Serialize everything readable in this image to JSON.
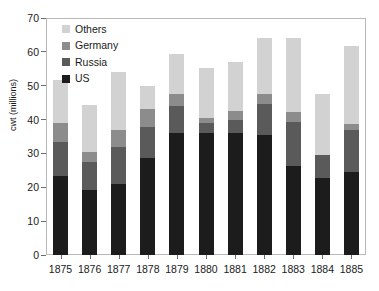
{
  "chart_data": {
    "type": "bar",
    "subtype": "stacked-bar",
    "title": "",
    "xlabel": "",
    "ylabel": "cwt (millions)",
    "ylim": [
      0,
      70
    ],
    "yticks": [
      0,
      10,
      20,
      30,
      40,
      50,
      60,
      70
    ],
    "grid": false,
    "legend_position": "top-left",
    "categories": [
      "1875",
      "1876",
      "1877",
      "1878",
      "1879",
      "1880",
      "1881",
      "1882",
      "1883",
      "1884",
      "1885"
    ],
    "series": [
      {
        "name": "US",
        "color": "#1c1c1c",
        "values": [
          23.4,
          19.2,
          21.0,
          28.8,
          36.0,
          36.0,
          36.0,
          35.3,
          26.2,
          22.6,
          24.4
        ]
      },
      {
        "name": "Russia",
        "color": "#5a5a5a",
        "values": [
          10.1,
          8.3,
          11.0,
          9.0,
          8.0,
          3.0,
          4.0,
          9.3,
          13.2,
          6.9,
          12.6
        ]
      },
      {
        "name": "Germany",
        "color": "#8c8c8c",
        "values": [
          5.5,
          3.0,
          5.0,
          5.2,
          3.6,
          1.5,
          2.5,
          3.0,
          2.9,
          0.0,
          1.6
        ]
      },
      {
        "name": "Others",
        "color": "#d2d2d2",
        "values": [
          12.7,
          13.8,
          17.2,
          6.8,
          11.7,
          14.7,
          14.5,
          16.4,
          21.7,
          18.1,
          23.2
        ]
      }
    ],
    "totals": [
      51.7,
      44.3,
      54.2,
      49.8,
      59.3,
      55.2,
      57.0,
      64.0,
      64.0,
      47.6,
      61.8
    ],
    "legend": [
      {
        "label": "Others",
        "color": "#d2d2d2"
      },
      {
        "label": "Germany",
        "color": "#8c8c8c"
      },
      {
        "label": "Russia",
        "color": "#5a5a5a"
      },
      {
        "label": "US",
        "color": "#1c1c1c"
      }
    ]
  }
}
